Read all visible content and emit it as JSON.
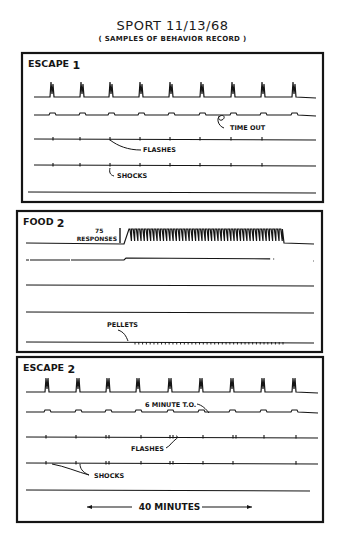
{
  "header": {
    "title": "SPORT   11/13/68",
    "subtitle": "( SAMPLES OF BEHAVIOR RECORD )"
  },
  "colors": {
    "ink": "#151515",
    "paper": "#ffffff"
  },
  "panels": [
    {
      "id": "escape1",
      "label": "ESCAPE",
      "label_num": "1",
      "box": {
        "x": 22,
        "y": 53,
        "w": 301,
        "h": 149
      },
      "response_trace": {
        "y": 97,
        "x0": 34,
        "x1": 316,
        "spike_height": 15,
        "spikes_x": [
          52,
          82,
          111,
          141,
          171,
          202,
          233,
          263,
          294
        ]
      },
      "step_trace": {
        "y": 115,
        "x0": 34,
        "x1": 316,
        "bumps_x": [
          52,
          82,
          111,
          141,
          171,
          202,
          233,
          263,
          294
        ]
      },
      "flash_trace": {
        "y": 139,
        "x0": 34,
        "x1": 316,
        "ticks_x": [
          53,
          80,
          110,
          140,
          170,
          200,
          231,
          262
        ]
      },
      "shock_trace": {
        "y": 165,
        "x0": 34,
        "x1": 316,
        "ticks_x": [
          53,
          80,
          110,
          140,
          170,
          200,
          231,
          262
        ]
      },
      "base_trace": {
        "y": 192,
        "x0": 28,
        "x1": 316
      },
      "annotations": [
        {
          "text": "TIME OUT",
          "x": 230,
          "y": 130
        },
        {
          "text": "FLASHES",
          "x": 143,
          "y": 152
        },
        {
          "text": "SHOCKS",
          "x": 117,
          "y": 178
        }
      ]
    },
    {
      "id": "food2",
      "label": "FOOD",
      "label_num": "2",
      "box": {
        "x": 17,
        "y": 211,
        "w": 305,
        "h": 141
      },
      "scale_bar": {
        "x": 120,
        "y_top": 228,
        "y_bottom": 243,
        "text_top": "75",
        "text_bottom": "RESPONSES"
      },
      "response_trace": {
        "y": 243,
        "x0": 26,
        "x1": 314,
        "burst_x0": 130,
        "burst_x1": 284,
        "burst_count": 48,
        "burst_height": 14
      },
      "step_trace": {
        "y": 260,
        "x0": 26,
        "x1": 314,
        "step_up_x": 124,
        "step_down_x": 284
      },
      "trace3": {
        "y": 285,
        "x0": 26,
        "x1": 314
      },
      "trace4": {
        "y": 312,
        "x0": 26,
        "x1": 314
      },
      "pellet_trace": {
        "y": 342,
        "x0": 26,
        "x1": 314,
        "ticks_x0": 135,
        "ticks_x1": 283,
        "tick_count": 40
      },
      "annotations": [
        {
          "text": "PELLETS",
          "x": 107,
          "y": 327
        }
      ]
    },
    {
      "id": "escape2",
      "label": "ESCAPE",
      "label_num": "2",
      "box": {
        "x": 17,
        "y": 357,
        "w": 306,
        "h": 165
      },
      "response_trace": {
        "y": 392,
        "x0": 26,
        "x1": 318,
        "spike_height": 14,
        "spikes_x": [
          47,
          78,
          108,
          138,
          170,
          201,
          232,
          263,
          294
        ]
      },
      "step_trace": {
        "y": 412,
        "x0": 26,
        "x1": 318,
        "bumps_x": [
          47,
          78,
          108,
          138,
          170,
          201,
          232,
          263,
          294
        ]
      },
      "flash_trace": {
        "y": 437,
        "x0": 26,
        "x1": 318,
        "ticks_x": [
          46,
          76,
          106,
          109,
          141,
          170,
          173,
          203,
          233,
          236,
          264,
          296
        ]
      },
      "shock_trace": {
        "y": 463,
        "x0": 26,
        "x1": 318,
        "ticks_x": [
          46,
          76,
          106,
          109,
          141,
          170,
          173,
          203,
          233,
          296
        ]
      },
      "base_trace": {
        "y": 490,
        "x0": 26,
        "x1": 310
      },
      "annotations": [
        {
          "text": "6 MINUTE T.O.",
          "x": 145,
          "y": 407
        },
        {
          "text": "FLASHES",
          "x": 131,
          "y": 451
        },
        {
          "text": "SHOCKS",
          "x": 94,
          "y": 478
        }
      ],
      "time_scale": {
        "text": "40 MINUTES",
        "x0": 87,
        "x1": 252,
        "y": 510
      }
    }
  ]
}
